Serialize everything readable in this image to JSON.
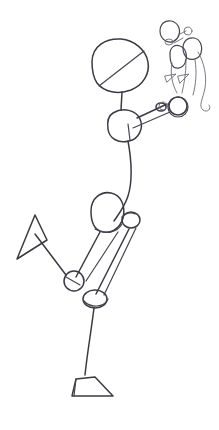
{
  "artwork": {
    "title": "Stick figure gesture sketch",
    "medium": "pencil line drawing",
    "background_color": "#ffffff",
    "ink_color": "#3a3a42",
    "canvas": {
      "width": 219,
      "height": 430
    }
  },
  "main_figure": {
    "name": "large stick figure",
    "pose": "standing on one leg, opposite leg raised and bent, one arm reaching up to the right",
    "parts": [
      {
        "part": "head",
        "shape": "oval with diagonal construction line"
      },
      {
        "part": "neck",
        "shape": "short straight line"
      },
      {
        "part": "chest",
        "shape": "rounded blob"
      },
      {
        "part": "spine",
        "shape": "long curved line"
      },
      {
        "part": "pelvis",
        "shape": "large oval"
      },
      {
        "part": "hip-joint",
        "shape": "small circle"
      },
      {
        "part": "raised-leg",
        "shape": "two straight lines to knee circle"
      },
      {
        "part": "raised-foot",
        "shape": "narrow triangle wedge"
      },
      {
        "part": "standing-leg",
        "shape": "long line to knee oval"
      },
      {
        "part": "standing-foot",
        "shape": "triangular wedge"
      },
      {
        "part": "arm",
        "shape": "two parallel lines to hand circle"
      }
    ]
  },
  "small_figure": {
    "name": "small creature figure",
    "position": "upper right",
    "parts": [
      {
        "part": "head",
        "shape": "small oval"
      },
      {
        "part": "snout",
        "shape": "tiny oval"
      },
      {
        "part": "body",
        "shape": "oval"
      },
      {
        "part": "second-head",
        "shape": "oval"
      },
      {
        "part": "front-feet",
        "shape": "two small triangles"
      },
      {
        "part": "hind-circle",
        "shape": "circle"
      },
      {
        "part": "tail",
        "shape": "long curling line"
      }
    ]
  }
}
